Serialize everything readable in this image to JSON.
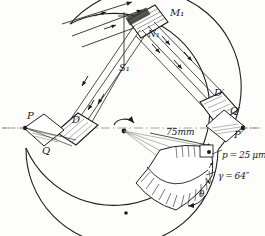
{
  "figure": {
    "labels": {
      "mirror_m1": "M₁",
      "mirror_n1": "N₁",
      "slit_s1": "S₁",
      "prism_d": "D",
      "point_p": "P",
      "point_q": "Q",
      "prism_d_prime": "D′",
      "point_q_prime": "Q′",
      "point_p_prime": "P′",
      "radius_dim": "75mm",
      "pitch": "p = 25 μm",
      "angle_gamma": "γ = 64″",
      "rotation_theta": "θ"
    },
    "colors": {
      "ink": "#1d1d1b",
      "ray": "#3a3a38",
      "construction": "#8c8c88",
      "paper": "#fdfdfc"
    },
    "values": {
      "radius_mm": 75,
      "grating_pitch_um": 25,
      "blaze_angle_arcsec": 64
    }
  }
}
